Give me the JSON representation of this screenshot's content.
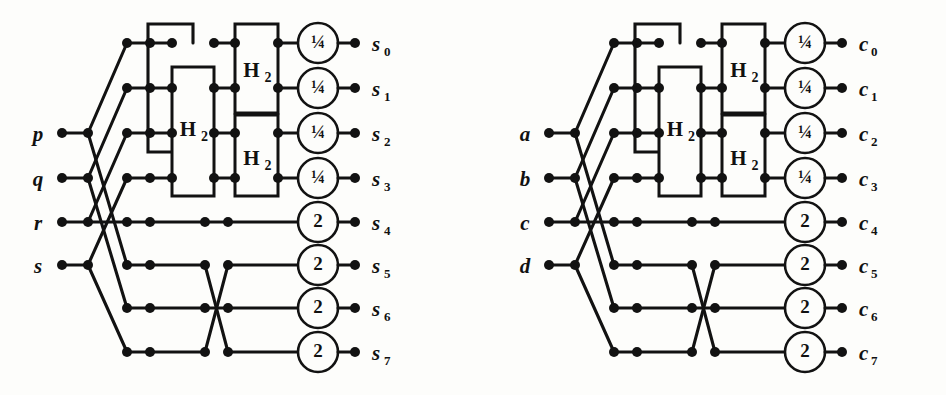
{
  "figure": {
    "type": "signal-flow-graph-pair",
    "background_color": "#fdfdfb",
    "line_color": "#121212"
  },
  "circuits": [
    {
      "id": "left",
      "origin_x": 0,
      "inputs": [
        {
          "label": "p",
          "row": 2
        },
        {
          "label": "q",
          "row": 3
        },
        {
          "label": "r",
          "row": 4
        },
        {
          "label": "s",
          "row": 5
        }
      ],
      "outputs": [
        {
          "label": "s",
          "sub": "0",
          "row": 0,
          "scale": "¼"
        },
        {
          "label": "s",
          "sub": "1",
          "row": 1,
          "scale": "¼"
        },
        {
          "label": "s",
          "sub": "2",
          "row": 2,
          "scale": "¼"
        },
        {
          "label": "s",
          "sub": "3",
          "row": 3,
          "scale": "¼"
        },
        {
          "label": "s",
          "sub": "4",
          "row": 4,
          "scale": "2"
        },
        {
          "label": "s",
          "sub": "5",
          "row": 5,
          "scale": "2"
        },
        {
          "label": "s",
          "sub": "6",
          "row": 6,
          "scale": "2"
        },
        {
          "label": "s",
          "sub": "7",
          "row": 7,
          "scale": "2"
        }
      ],
      "gates": [
        {
          "name": "H",
          "sub": "2",
          "rows": [
            1,
            3
          ],
          "stage": "mid"
        },
        {
          "name": "H",
          "sub": "2",
          "rows": [
            0,
            1
          ],
          "stage": "right"
        },
        {
          "name": "H",
          "sub": "2",
          "rows": [
            2,
            3
          ],
          "stage": "right"
        }
      ]
    },
    {
      "id": "right",
      "origin_x": 487,
      "inputs": [
        {
          "label": "a",
          "row": 2
        },
        {
          "label": "b",
          "row": 3
        },
        {
          "label": "c",
          "row": 4
        },
        {
          "label": "d",
          "row": 5
        }
      ],
      "outputs": [
        {
          "label": "c",
          "sub": "0",
          "row": 0,
          "scale": "¼"
        },
        {
          "label": "c",
          "sub": "1",
          "row": 1,
          "scale": "¼"
        },
        {
          "label": "c",
          "sub": "2",
          "row": 2,
          "scale": "¼"
        },
        {
          "label": "c",
          "sub": "3",
          "row": 3,
          "scale": "¼"
        },
        {
          "label": "c",
          "sub": "4",
          "row": 4,
          "scale": "2"
        },
        {
          "label": "c",
          "sub": "5",
          "row": 5,
          "scale": "2"
        },
        {
          "label": "c",
          "sub": "6",
          "row": 6,
          "scale": "2"
        },
        {
          "label": "c",
          "sub": "7",
          "row": 7,
          "scale": "2"
        }
      ],
      "gates": [
        {
          "name": "H",
          "sub": "2",
          "rows": [
            1,
            3
          ],
          "stage": "mid"
        },
        {
          "name": "H",
          "sub": "2",
          "rows": [
            0,
            1
          ],
          "stage": "right"
        },
        {
          "name": "H",
          "sub": "2",
          "rows": [
            2,
            3
          ],
          "stage": "right"
        }
      ]
    }
  ],
  "geometry": {
    "row_y": [
      43,
      88,
      133,
      178,
      222,
      265,
      308,
      352
    ],
    "in_label_x": 38,
    "in_dot_x": 62,
    "x_fan": 88,
    "x_cross_a": 127,
    "x_cross_b": 150,
    "x_box1_l": 148,
    "x_box1_r": 193,
    "x_mid_l": 172,
    "x_mid_r": 214,
    "x_right_l": 235,
    "x_right_r": 278,
    "x_scale": 318,
    "x_out_dot": 355,
    "x_out_label": 372,
    "box_top": 24,
    "box_split": 113,
    "box_bottom": 196,
    "mid_top": 67,
    "scale_r": 20
  }
}
